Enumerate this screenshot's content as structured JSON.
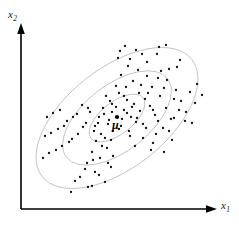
{
  "figure": {
    "background_color": "#ffffff",
    "width": 239,
    "height": 227
  },
  "axes": {
    "x_label": "x",
    "x_label_sub": "1",
    "y_label": "x",
    "y_label_sub": "2",
    "color": "#000000",
    "origin": [
      21,
      209
    ],
    "x_axis_end": [
      217,
      209
    ],
    "y_axis_end": [
      21,
      25
    ],
    "arrowheads": true,
    "ticks": false,
    "tick_labels": []
  },
  "annotations": {
    "mean_symbol": "μ",
    "mean_symbol_color": "#000000",
    "mean_position": [
      117,
      118
    ]
  },
  "chart_data": {
    "type": "scatter",
    "title": "",
    "subtitle": "",
    "xlabel": "x1",
    "ylabel": "x2",
    "grid": false,
    "legend": null,
    "legend_position": "none",
    "xlim": [
      21,
      217
    ],
    "ylim": [
      25,
      209
    ],
    "axis_tick_labels": {
      "x": [],
      "y": []
    },
    "point_color": "#111111",
    "point_radius": 1.15,
    "point_count": 132,
    "distribution": {
      "name": "bivariate normal",
      "mean": [
        117,
        118
      ],
      "orientation_deg": -38,
      "sigma_major": 30,
      "sigma_minor": 14.5,
      "correlation": "positive"
    },
    "contours": {
      "shape": "ellipse",
      "count": 3,
      "stroke_color": "#b0b0b0",
      "stroke_width": 0.7,
      "fill": "none",
      "center": [
        117,
        118
      ],
      "rotation_deg": -38,
      "levels": [
        {
          "name": "1-sigma",
          "rx": 33,
          "ry": 16
        },
        {
          "name": "2-sigma",
          "rx": 64,
          "ry": 33
        },
        {
          "name": "3-sigma",
          "rx": 95,
          "ry": 50
        }
      ]
    },
    "points": [
      [
        117,
        117
      ],
      [
        103,
        108
      ],
      [
        112,
        104
      ],
      [
        124,
        110
      ],
      [
        131,
        117
      ],
      [
        108,
        124
      ],
      [
        121,
        126
      ],
      [
        99,
        117
      ],
      [
        134,
        104
      ],
      [
        113,
        131
      ],
      [
        127,
        100
      ],
      [
        95,
        126
      ],
      [
        140,
        111
      ],
      [
        106,
        96
      ],
      [
        129,
        131
      ],
      [
        90,
        112
      ],
      [
        145,
        99
      ],
      [
        101,
        134
      ],
      [
        136,
        122
      ],
      [
        119,
        93
      ],
      [
        111,
        140
      ],
      [
        150,
        106
      ],
      [
        86,
        123
      ],
      [
        139,
        93
      ],
      [
        96,
        141
      ],
      [
        126,
        87
      ],
      [
        155,
        115
      ],
      [
        82,
        105
      ],
      [
        146,
        128
      ],
      [
        107,
        148
      ],
      [
        133,
        81
      ],
      [
        160,
        96
      ],
      [
        78,
        134
      ],
      [
        152,
        87
      ],
      [
        92,
        152
      ],
      [
        121,
        75
      ],
      [
        166,
        108
      ],
      [
        73,
        117
      ],
      [
        143,
        138
      ],
      [
        100,
        158
      ],
      [
        138,
        70
      ],
      [
        171,
        119
      ],
      [
        69,
        142
      ],
      [
        158,
        78
      ],
      [
        87,
        163
      ],
      [
        128,
        66
      ],
      [
        176,
        90
      ],
      [
        64,
        126
      ],
      [
        163,
        128
      ],
      [
        111,
        167
      ],
      [
        147,
        62
      ],
      [
        181,
        101
      ],
      [
        60,
        110
      ],
      [
        153,
        143
      ],
      [
        95,
        172
      ],
      [
        118,
        58
      ],
      [
        186,
        112
      ],
      [
        56,
        150
      ],
      [
        169,
        69
      ],
      [
        80,
        177
      ],
      [
        157,
        54
      ],
      [
        192,
        123
      ],
      [
        51,
        133
      ],
      [
        174,
        118
      ],
      [
        105,
        182
      ],
      [
        136,
        50
      ],
      [
        197,
        84
      ],
      [
        47,
        117
      ],
      [
        164,
        152
      ],
      [
        88,
        187
      ],
      [
        125,
        46
      ],
      [
        202,
        95
      ],
      [
        43,
        158
      ],
      [
        180,
        60
      ],
      [
        71,
        192
      ],
      [
        166,
        45
      ],
      [
        112,
        112
      ],
      [
        122,
        119
      ],
      [
        109,
        120
      ],
      [
        116,
        107
      ],
      [
        127,
        113
      ],
      [
        104,
        114
      ],
      [
        119,
        129
      ],
      [
        132,
        107
      ],
      [
        98,
        123
      ],
      [
        137,
        118
      ],
      [
        110,
        101
      ],
      [
        124,
        96
      ],
      [
        94,
        131
      ],
      [
        143,
        124
      ],
      [
        88,
        108
      ],
      [
        148,
        93
      ],
      [
        105,
        138
      ],
      [
        130,
        136
      ],
      [
        116,
        86
      ],
      [
        153,
        110
      ],
      [
        83,
        127
      ],
      [
        141,
        85
      ],
      [
        102,
        146
      ],
      [
        158,
        121
      ],
      [
        77,
        114
      ],
      [
        135,
        146
      ],
      [
        113,
        156
      ],
      [
        164,
        88
      ],
      [
        72,
        139
      ],
      [
        147,
        76
      ],
      [
        93,
        160
      ],
      [
        169,
        131
      ],
      [
        67,
        121
      ],
      [
        156,
        134
      ],
      [
        108,
        163
      ],
      [
        174,
        99
      ],
      [
        62,
        146
      ],
      [
        161,
        71
      ],
      [
        85,
        169
      ],
      [
        130,
        59
      ],
      [
        179,
        110
      ],
      [
        58,
        129
      ],
      [
        151,
        150
      ],
      [
        99,
        175
      ],
      [
        142,
        54
      ],
      [
        185,
        121
      ],
      [
        53,
        113
      ],
      [
        167,
        80
      ],
      [
        75,
        181
      ],
      [
        120,
        51
      ],
      [
        190,
        92
      ],
      [
        49,
        153
      ],
      [
        172,
        140
      ],
      [
        92,
        186
      ],
      [
        159,
        47
      ],
      [
        195,
        103
      ],
      [
        45,
        136
      ],
      [
        177,
        67
      ]
    ]
  }
}
